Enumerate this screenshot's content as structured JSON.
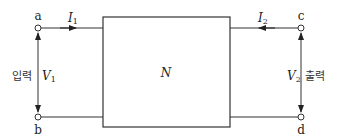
{
  "diagram": {
    "type": "two-port-network",
    "network_label": "N",
    "terminals": [
      {
        "id": "a",
        "label": "a"
      },
      {
        "id": "b",
        "label": "b"
      },
      {
        "id": "c",
        "label": "c"
      },
      {
        "id": "d",
        "label": "d"
      }
    ],
    "currents": [
      {
        "symbol": "I",
        "subscript": "1",
        "direction": "into network, left port"
      },
      {
        "symbol": "I",
        "subscript": "2",
        "direction": "into network, right port"
      }
    ],
    "voltages": [
      {
        "symbol": "V",
        "subscript": "1",
        "caption": "입력"
      },
      {
        "symbol": "V",
        "subscript": "2",
        "caption": "출력"
      }
    ],
    "colors": {
      "line": "#333333",
      "background": "#ffffff"
    }
  }
}
